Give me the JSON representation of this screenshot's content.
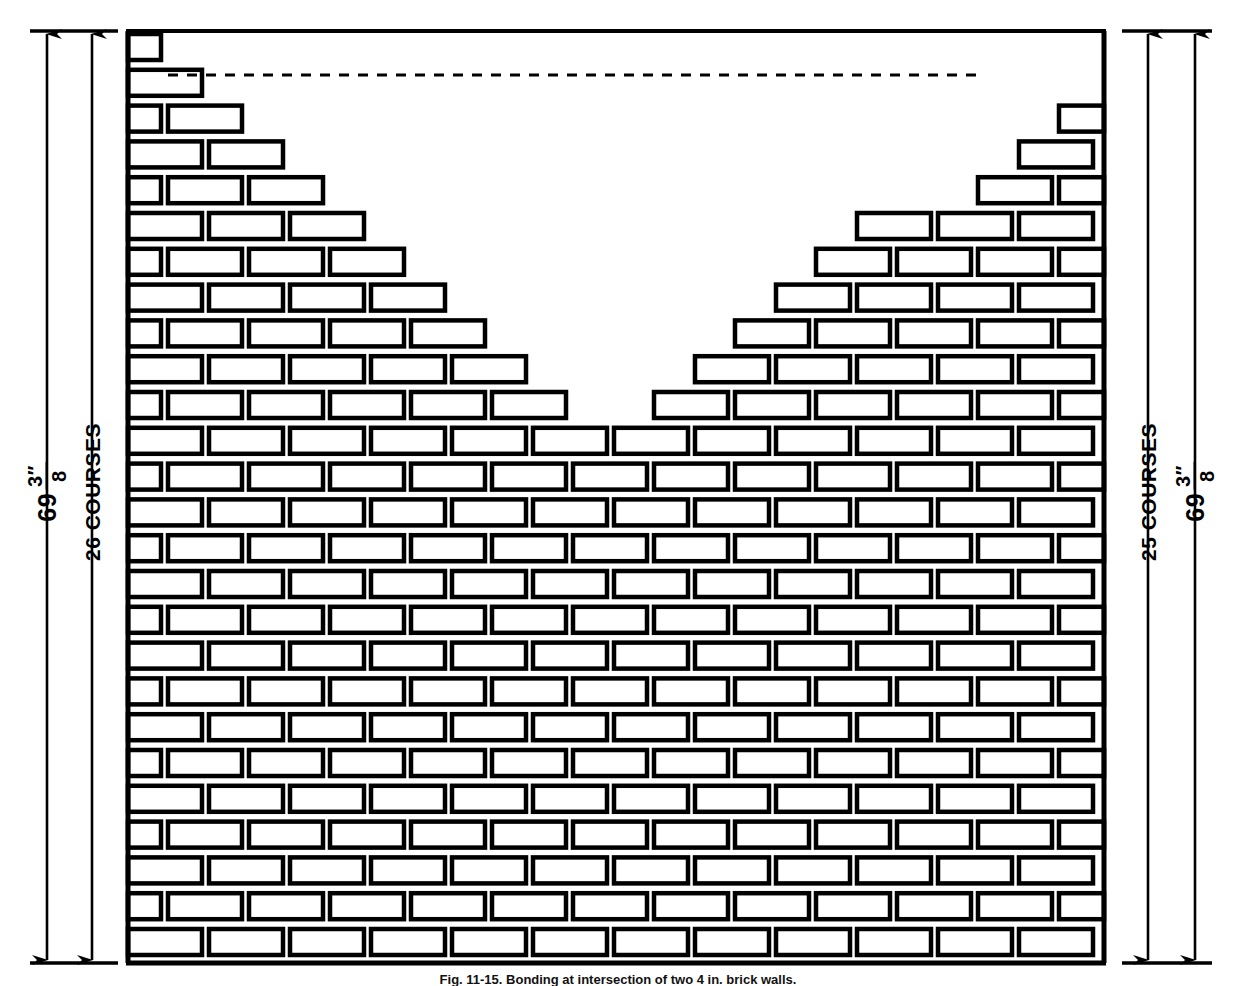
{
  "figure": {
    "caption": "Fig. 11-15. Bonding at intersection of two 4 in. brick walls.",
    "ink_color": "#000000",
    "background_color": "#ffffff"
  },
  "dimensions": {
    "left": {
      "outer": {
        "value": "69",
        "fraction_numerator": "3″",
        "fraction_denominator": "8",
        "full_text": "69 3/8″",
        "arrow_x": 47,
        "style": "double-headed-vertical-arrow"
      },
      "inner": {
        "label": "26 COURSES",
        "arrow_x": 92,
        "style": "double-headed-vertical-arrow"
      }
    },
    "right": {
      "inner": {
        "label": "25 COURSES",
        "arrow_x": 1148,
        "style": "double-headed-vertical-arrow"
      },
      "outer": {
        "value": "69",
        "fraction_numerator": "3″",
        "fraction_denominator": "8",
        "full_text": "69 3/8″",
        "arrow_x": 1195,
        "style": "double-headed-vertical-arrow"
      }
    },
    "extension_lines": {
      "top_y": 31,
      "bottom_y": 963
    }
  },
  "wall": {
    "left_edge": 128,
    "right_edge": 1104,
    "top_y": 31,
    "bottom_y": 963,
    "course_pitch": 35.8,
    "course_count_left": 26,
    "course_count_right": 25,
    "brick_pitch": 81,
    "brick_length": 74,
    "brick_height": 26,
    "bond": "running bond",
    "notch": {
      "type": "stepped V",
      "apex_x": 616,
      "apex_y": 421,
      "description": "symmetric stepped V-shaped notch descending from top of wall to course 11"
    }
  },
  "dashed_line": {
    "y": 75,
    "x_start": 168,
    "x_end": 985,
    "dash": "10 9",
    "description": "horizontal reference line at top of second course"
  },
  "icons": {
    "arrow_up": "arrow-up-icon",
    "arrow_down": "arrow-down-icon"
  }
}
